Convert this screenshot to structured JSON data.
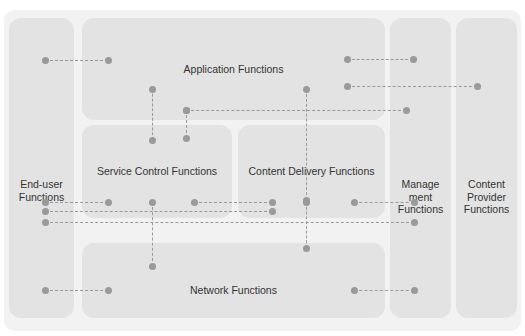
{
  "diagram": {
    "background_color": "#f2f2f2",
    "block_color": "#e3e3e3",
    "connector_color": "#9a9a9a",
    "text_color": "#333333"
  },
  "blocks": {
    "end_user": "End-user\nFunctions",
    "end_user_line1": "End-user",
    "end_user_line2": "Functions",
    "application": "Application Functions",
    "service_control": "Service Control Functions",
    "content_delivery": "Content Delivery Functions",
    "network": "Network Functions",
    "management_line1": "Manage",
    "management_line2": "ment",
    "management_line3": "Functions",
    "content_provider_line1": "Content",
    "content_provider_line2": "Provider",
    "content_provider_line3": "Functions"
  },
  "connectors": [
    {
      "id": "euf-appf",
      "type": "h",
      "x1": 45,
      "x2": 108,
      "y": 60
    },
    {
      "id": "appf-mgf-upper",
      "type": "h",
      "x1": 347,
      "x2": 413,
      "y": 59
    },
    {
      "id": "appf-cpf",
      "type": "h",
      "x1": 347,
      "x2": 477,
      "y": 86
    },
    {
      "id": "appf-scf-vertical",
      "type": "v",
      "x": 152,
      "y1": 89,
      "y2": 140
    },
    {
      "id": "appf-cdf-vertical",
      "type": "v",
      "x": 306,
      "y1": 89,
      "y2": 200
    },
    {
      "id": "scf-branch-vertical",
      "type": "v",
      "x": 186,
      "y1": 110,
      "y2": 138
    },
    {
      "id": "appf-mgf-long",
      "type": "h",
      "x1": 186,
      "x2": 406,
      "y": 110
    },
    {
      "id": "euf-scf",
      "type": "h",
      "x1": 45,
      "x2": 108,
      "y": 202
    },
    {
      "id": "scf-cdf",
      "type": "h",
      "x1": 194,
      "x2": 272,
      "y": 202
    },
    {
      "id": "cdf-mgf",
      "type": "h",
      "x1": 354,
      "x2": 414,
      "y": 202
    },
    {
      "id": "euf-cdf-long",
      "type": "h",
      "x1": 45,
      "x2": 272,
      "y": 211
    },
    {
      "id": "euf-mgf-long",
      "type": "h",
      "x1": 45,
      "x2": 414,
      "y": 222
    },
    {
      "id": "scf-netf-vertical",
      "type": "v",
      "x": 152,
      "y1": 202,
      "y2": 266
    },
    {
      "id": "cdf-netf-vertical",
      "type": "v",
      "x": 306,
      "y1": 202,
      "y2": 248
    },
    {
      "id": "euf-netf",
      "type": "h",
      "x1": 45,
      "x2": 108,
      "y": 290
    },
    {
      "id": "netf-mgf",
      "type": "h",
      "x1": 354,
      "x2": 414,
      "y": 290
    }
  ]
}
